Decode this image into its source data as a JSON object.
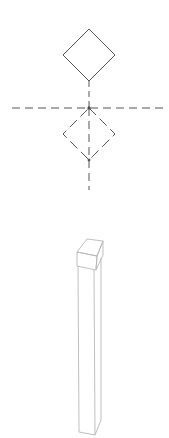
{
  "diagram": {
    "colors": {
      "symbol_stroke": "#555555",
      "column_stroke": "#b8b8b8",
      "background": "#ffffff"
    },
    "symbol": {
      "top_diamond": {
        "style": "solid",
        "cx": 89,
        "cy": 55,
        "half": 26
      },
      "bottom_diamond": {
        "style": "dashed",
        "cx": 89,
        "cy": 134,
        "half": 26
      },
      "horizontal_centerline": {
        "y": 108,
        "x1": 12,
        "x2": 165
      },
      "vertical_centerline": {
        "x": 89,
        "y1": 81,
        "y2": 190
      }
    },
    "column": {
      "description": "Isometric tall rectangular post with square cap"
    }
  }
}
